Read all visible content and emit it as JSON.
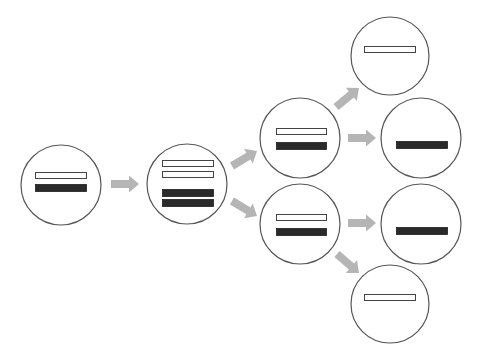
{
  "diagram": {
    "title": "",
    "colors": {
      "background": "#ffffff",
      "circle_stroke": "#555555",
      "bar_open_fill": "#ffffff",
      "bar_open_stroke": "#444444",
      "bar_filled": "#2a2a2a",
      "arrow_start": "#b5b5b5",
      "arrow_end": "#5a5a5a"
    },
    "nodes": [
      {
        "id": "n1",
        "label": "parent cell",
        "cx": 61,
        "cy": 185,
        "r": 40,
        "bars": [
          {
            "type": "open",
            "x": 35,
            "y": 172,
            "w": 51,
            "h": 6
          },
          {
            "type": "filled",
            "x": 35,
            "y": 184,
            "w": 51,
            "h": 7
          }
        ]
      },
      {
        "id": "n2",
        "label": "duplicated cell",
        "cx": 187,
        "cy": 184,
        "r": 40,
        "bars": [
          {
            "type": "open",
            "x": 162,
            "y": 160,
            "w": 51,
            "h": 6
          },
          {
            "type": "open",
            "x": 162,
            "y": 171,
            "w": 51,
            "h": 6
          },
          {
            "type": "filled",
            "x": 162,
            "y": 189,
            "w": 51,
            "h": 7
          },
          {
            "type": "filled",
            "x": 162,
            "y": 199,
            "w": 51,
            "h": 7
          }
        ]
      },
      {
        "id": "n3",
        "label": "daughter cell upper",
        "cx": 300,
        "cy": 138,
        "r": 40,
        "bars": [
          {
            "type": "open",
            "x": 276,
            "y": 128,
            "w": 50,
            "h": 6
          },
          {
            "type": "filled",
            "x": 276,
            "y": 142,
            "w": 50,
            "h": 7
          }
        ]
      },
      {
        "id": "n4",
        "label": "daughter cell lower",
        "cx": 300,
        "cy": 224,
        "r": 40,
        "bars": [
          {
            "type": "open",
            "x": 276,
            "y": 214,
            "w": 50,
            "h": 6
          },
          {
            "type": "filled",
            "x": 276,
            "y": 228,
            "w": 50,
            "h": 7
          }
        ]
      },
      {
        "id": "n5",
        "label": "open-bar cell top",
        "cx": 390,
        "cy": 56,
        "r": 39,
        "bars": [
          {
            "type": "open",
            "x": 364,
            "y": 46,
            "w": 51,
            "h": 6
          }
        ]
      },
      {
        "id": "n6",
        "label": "filled-bar cell upper",
        "cx": 421,
        "cy": 138,
        "r": 40,
        "bars": [
          {
            "type": "filled",
            "x": 396,
            "y": 141,
            "w": 51,
            "h": 7
          }
        ]
      },
      {
        "id": "n7",
        "label": "filled-bar cell lower",
        "cx": 421,
        "cy": 224,
        "r": 40,
        "bars": [
          {
            "type": "filled",
            "x": 396,
            "y": 227,
            "w": 51,
            "h": 7
          }
        ]
      },
      {
        "id": "n8",
        "label": "open-bar cell bottom",
        "cx": 390,
        "cy": 304,
        "r": 39,
        "bars": [
          {
            "type": "open",
            "x": 364,
            "y": 294,
            "w": 51,
            "h": 6
          }
        ]
      }
    ],
    "arrows": [
      {
        "id": "a1",
        "from": "n1",
        "to": "n2",
        "x1": 111,
        "y1": 184,
        "x2": 139,
        "y2": 184
      },
      {
        "id": "a2",
        "from": "n2",
        "to": "n3",
        "x1": 232,
        "y1": 166,
        "x2": 257,
        "y2": 151
      },
      {
        "id": "a3",
        "from": "n2",
        "to": "n4",
        "x1": 232,
        "y1": 201,
        "x2": 257,
        "y2": 216
      },
      {
        "id": "a4",
        "from": "n3",
        "to": "n5",
        "x1": 336,
        "y1": 107,
        "x2": 359,
        "y2": 88
      },
      {
        "id": "a5",
        "from": "n3",
        "to": "n6",
        "x1": 348,
        "y1": 138,
        "x2": 376,
        "y2": 138
      },
      {
        "id": "a6",
        "from": "n4",
        "to": "n7",
        "x1": 348,
        "y1": 223,
        "x2": 376,
        "y2": 223
      },
      {
        "id": "a7",
        "from": "n4",
        "to": "n8",
        "x1": 337,
        "y1": 254,
        "x2": 359,
        "y2": 273
      }
    ]
  }
}
